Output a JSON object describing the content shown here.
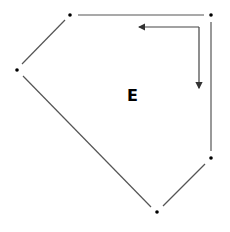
{
  "diagram": {
    "face_label": "E",
    "vertices": [
      {
        "id": "v1",
        "x": 70,
        "y": 15
      },
      {
        "id": "v2",
        "x": 211,
        "y": 15
      },
      {
        "id": "v3",
        "x": 17,
        "y": 70
      },
      {
        "id": "v4",
        "x": 211,
        "y": 158
      },
      {
        "id": "v5",
        "x": 157,
        "y": 212
      }
    ],
    "edges": [
      [
        "v1",
        "v2"
      ],
      [
        "v2",
        "v4"
      ],
      [
        "v4",
        "v5"
      ],
      [
        "v5",
        "v3"
      ],
      [
        "v3",
        "v1"
      ]
    ],
    "orientation_arrow": {
      "corner": [
        199,
        27
      ],
      "horizontal_end": [
        137,
        27
      ],
      "vertical_end": [
        199,
        90
      ],
      "description": "L-shaped arrow indicating traversal direction"
    },
    "colors": {
      "edge": "#555555",
      "vertex": "#000000",
      "background": "#ffffff"
    }
  }
}
